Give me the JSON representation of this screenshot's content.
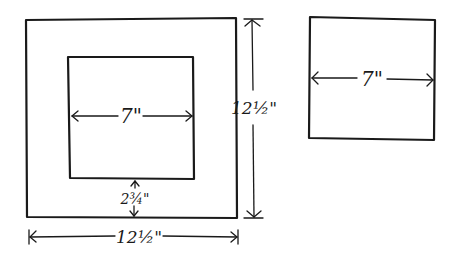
{
  "diagram": {
    "type": "quilt-block-sketch",
    "left_figure": {
      "outer_square": {
        "width_label": "12½\"",
        "height_label": "12½\""
      },
      "inner_square": {
        "width_label": "7\""
      },
      "border_label": "2¾\""
    },
    "right_figure": {
      "square": {
        "width_label": "7\""
      }
    }
  },
  "colors": {
    "ink": "#1a1a1a",
    "background": "#ffffff"
  }
}
